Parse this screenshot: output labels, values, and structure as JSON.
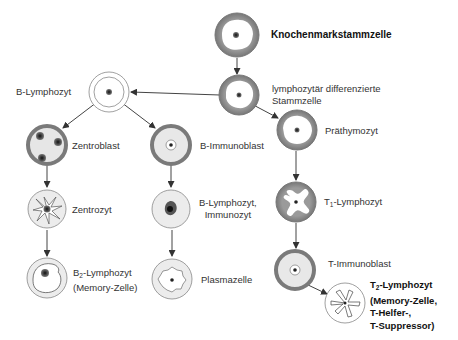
{
  "nodes": {
    "stem": {
      "label": "Knochenmarkstammzelle"
    },
    "lymph_stem": {
      "line1": "lymphozytär differenzierte",
      "line2": "Stammzelle"
    },
    "b_lymph": {
      "label": "B-Lymphozyt"
    },
    "zentroblast": {
      "label": "Zentroblast"
    },
    "b_immunoblast": {
      "label": "B-Immunoblast"
    },
    "prathymozyt": {
      "label": "Präthymozyt"
    },
    "zentrozyt": {
      "label": "Zentrozyt"
    },
    "immunozyt": {
      "line1": "B-Lymphozyt,",
      "line2": "Immunozyt"
    },
    "t1": {
      "prefix": "T",
      "sub": "1",
      "suffix": "-Lymphozyt"
    },
    "b2": {
      "prefix": "B",
      "sub": "2",
      "suffix": "-Lymphozyt",
      "line2": "(Memory-Zelle)"
    },
    "plasmazelle": {
      "label": "Plasmazelle"
    },
    "t_immunoblast": {
      "label": "T-Immunoblast"
    },
    "t2": {
      "prefix": "T",
      "sub": "2",
      "suffix": "-Lymphozyt",
      "line2": "(Memory-Zelle,",
      "line3": "T-Helfer-,",
      "line4": "T-Suppressor)"
    }
  },
  "colors": {
    "ring_dark": "#8a8a8a",
    "ring_light": "#cfcfcf",
    "cell_fill": "#ececec",
    "nucleus": "#333333",
    "arrow": "#444444"
  }
}
